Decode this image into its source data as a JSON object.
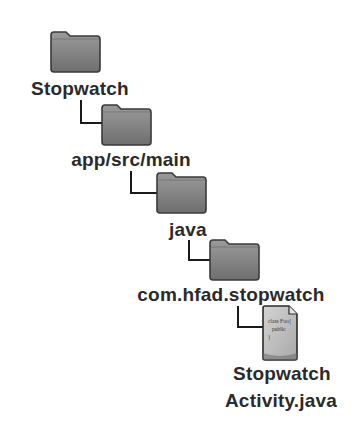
{
  "tree": {
    "nodes": [
      {
        "type": "folder",
        "label": "Stopwatch",
        "icon": "folder-icon"
      },
      {
        "type": "folder",
        "label": "app/src/main",
        "icon": "folder-icon"
      },
      {
        "type": "folder",
        "label": "java",
        "icon": "folder-icon"
      },
      {
        "type": "folder",
        "label": "com.hfad.stopwatch",
        "icon": "folder-icon"
      },
      {
        "type": "file",
        "label_line1": "Stopwatch",
        "label_line2": "Activity.java",
        "icon": "java-file-icon",
        "file_snippet": "class Foo{ public"
      }
    ]
  },
  "colors": {
    "folder_fill": "#8a8a8a",
    "folder_edge": "#3a3a3a",
    "file_fill": "#c8c8c8",
    "connector": "#1a1a1a",
    "text": "#2a2a2a"
  }
}
